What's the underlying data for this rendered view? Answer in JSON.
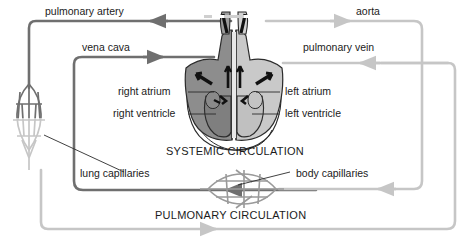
{
  "diagram": {
    "title_systemic": "SYSTEMIC CIRCULATION",
    "title_pulmonary": "PULMONARY CIRCULATION",
    "vessels": {
      "pulmonary_artery": "pulmonary artery",
      "aorta": "aorta",
      "vena_cava": "vena cava",
      "pulmonary_vein": "pulmonary vein"
    },
    "heart_chambers": {
      "right_atrium": "right atrium",
      "right_ventricle": "right ventricle",
      "left_atrium": "left atrium",
      "left_ventricle": "left ventricle"
    },
    "capillaries": {
      "lung": "lung capillaries",
      "body": "body capillaries"
    },
    "colors": {
      "deoxygenated_line": "#6f6f6f",
      "oxygenated_line": "#c6c6c6",
      "heart_right_fill": "#8d8d8d",
      "heart_left_fill": "#c9c9c9",
      "heart_outline": "#2b2b2b",
      "text": "#1b1b1b",
      "background": "#ffffff"
    }
  }
}
